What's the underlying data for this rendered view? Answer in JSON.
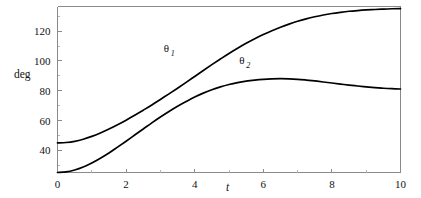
{
  "chart_data": {
    "type": "line",
    "title": "",
    "subtitle": "",
    "xlabel": "t",
    "ylabel": "deg",
    "xlim": [
      0,
      10
    ],
    "ylim": [
      25.2,
      136.5
    ],
    "grid": false,
    "legend_position": "inline-annotation",
    "x_ticks": [
      {
        "value": 0,
        "label": "0"
      },
      {
        "value": 2,
        "label": "2"
      },
      {
        "value": 4,
        "label": "4"
      },
      {
        "value": 6,
        "label": "6"
      },
      {
        "value": 8,
        "label": "8"
      },
      {
        "value": 10,
        "label": "10"
      }
    ],
    "y_ticks": [
      {
        "value": 40,
        "label": "40"
      },
      {
        "value": 60,
        "label": "60"
      },
      {
        "value": 80,
        "label": "80"
      },
      {
        "value": 100,
        "label": "100"
      },
      {
        "value": 120,
        "label": "120"
      }
    ],
    "x_minor_ticks": [
      1,
      3,
      5,
      7,
      9
    ],
    "y_minor_ticks": [
      30,
      50,
      70,
      90,
      110,
      130
    ],
    "x": [
      0,
      0.25,
      0.5,
      0.75,
      1,
      1.25,
      1.5,
      1.75,
      2,
      2.25,
      2.5,
      2.75,
      3,
      3.25,
      3.5,
      3.75,
      4,
      4.25,
      4.5,
      4.75,
      5,
      5.25,
      5.5,
      5.75,
      6,
      6.25,
      6.5,
      6.75,
      7,
      7.25,
      7.5,
      7.75,
      8,
      8.25,
      8.5,
      8.75,
      9,
      9.25,
      9.5,
      9.75,
      10
    ],
    "series": [
      {
        "name": "theta_1",
        "label": "θ",
        "subscript": "1",
        "color": "#000000",
        "annotation_x": 3.1,
        "annotation_y": 106,
        "values": [
          45.0,
          45.3,
          46.1,
          47.5,
          49.4,
          51.7,
          54.3,
          57.2,
          60.3,
          63.6,
          67.0,
          70.5,
          74.2,
          77.9,
          81.7,
          85.6,
          89.6,
          93.6,
          97.5,
          101.3,
          105.0,
          108.5,
          111.8,
          114.9,
          117.7,
          120.3,
          122.6,
          124.7,
          126.6,
          128.2,
          129.6,
          130.8,
          131.8,
          132.6,
          133.3,
          133.8,
          134.2,
          134.5,
          134.8,
          135.0,
          135.1
        ]
      },
      {
        "name": "theta_2",
        "label": "θ",
        "subscript": "2",
        "color": "#000000",
        "annotation_x": 5.3,
        "annotation_y": 98,
        "values": [
          25.2,
          25.6,
          26.9,
          28.9,
          31.6,
          34.8,
          38.3,
          42.2,
          46.2,
          50.3,
          54.4,
          58.5,
          62.4,
          66.1,
          69.6,
          72.8,
          75.8,
          78.4,
          80.7,
          82.6,
          84.2,
          85.5,
          86.5,
          87.2,
          87.7,
          88.0,
          88.1,
          88.0,
          87.7,
          87.2,
          86.6,
          85.9,
          85.2,
          84.5,
          83.8,
          83.2,
          82.6,
          82.1,
          81.7,
          81.4,
          81.2
        ]
      }
    ]
  },
  "axes": {
    "y_axis_title": "deg",
    "x_axis_title": "t"
  }
}
